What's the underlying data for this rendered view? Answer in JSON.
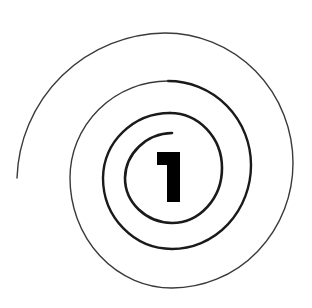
{
  "figure": {
    "numeral": "1",
    "colors": {
      "background": "#ffffff",
      "stroke": "#1a1a1a",
      "numeral": "#000000"
    }
  }
}
